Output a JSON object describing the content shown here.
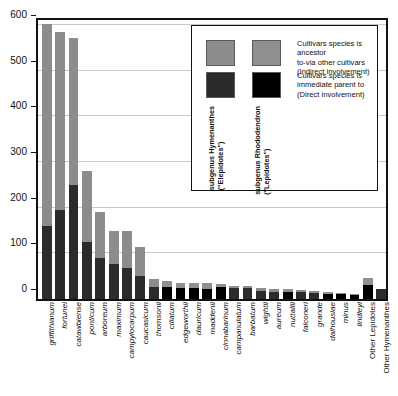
{
  "chart_data": {
    "type": "bar",
    "subtype": "stacked",
    "title": "",
    "xlabel": "",
    "ylabel": "",
    "ylim": [
      0,
      620
    ],
    "yticks": [
      0,
      100,
      200,
      300,
      400,
      500,
      600
    ],
    "grid": true,
    "legend_position": "top-right-inside",
    "categories": [
      "griffithianum",
      "fortunei",
      "catawbiense",
      "ponticum",
      "arboreum",
      "maximum",
      "campylocarpum",
      "caucasicum",
      "thomsonii",
      "ciliatum",
      "edgeworthii",
      "dauricum",
      "maddenii",
      "cinnabarinum",
      "campanulatum",
      "barbatum",
      "wightii",
      "aureum",
      "nuttallii",
      "falconeri",
      "grande",
      "dalhousiae",
      "minus",
      "lindleyi",
      "Other Lepidotes",
      "Other Hymenanthes"
    ],
    "category_styles": [
      "italic",
      "italic",
      "italic",
      "italic",
      "italic",
      "italic",
      "italic",
      "italic",
      "italic",
      "italic",
      "italic",
      "italic",
      "italic",
      "italic",
      "italic",
      "italic",
      "italic",
      "italic",
      "italic",
      "italic",
      "italic",
      "italic",
      "italic",
      "italic",
      "plain",
      "plain"
    ],
    "category_subgenus": [
      "Hymenanthes",
      "Hymenanthes",
      "Hymenanthes",
      "Hymenanthes",
      "Hymenanthes",
      "Hymenanthes",
      "Hymenanthes",
      "Hymenanthes",
      "Hymenanthes",
      "Rhododendron",
      "Rhododendron",
      "Rhododendron",
      "Rhododendron",
      "Rhododendron",
      "Hymenanthes",
      "Hymenanthes",
      "Hymenanthes",
      "Hymenanthes",
      "Rhododendron",
      "Hymenanthes",
      "Hymenanthes",
      "Rhododendron",
      "Rhododendron",
      "Rhododendron",
      "Rhododendron",
      "Hymenanthes"
    ],
    "series": [
      {
        "name": "Cultivars species is immediate parent to (Direct involvement)",
        "key": "direct",
        "values": [
          160,
          196,
          250,
          125,
          89,
          77,
          68,
          51,
          27,
          27,
          25,
          25,
          23,
          26,
          24,
          24,
          18,
          16,
          16,
          15,
          13,
          12,
          10,
          9,
          31,
          22
        ]
      },
      {
        "name": "Cultivars species is ancestor to-via other cultivars (Indirect involvement)",
        "key": "indirect",
        "values": [
          443,
          389,
          321,
          156,
          102,
          72,
          81,
          62,
          16,
          12,
          11,
          9,
          11,
          7,
          4,
          4,
          6,
          6,
          5,
          4,
          4,
          3,
          3,
          3,
          14,
          0
        ]
      }
    ],
    "totals": [
      603,
      585,
      571,
      281,
      191,
      149,
      149,
      113,
      43,
      39,
      36,
      34,
      34,
      33,
      28,
      28,
      24,
      22,
      21,
      19,
      17,
      15,
      13,
      12,
      45,
      22
    ]
  },
  "legend": {
    "entries": [
      {
        "swatch_color_hymenanthes": "#8c8c8c",
        "swatch_color_rhododendron": "#8f8f8f",
        "text": "Cultivars species is ancestor\n to-via other cultivars\n(Indirect involvement)"
      },
      {
        "swatch_color_hymenanthes": "#2b2b2b",
        "swatch_color_rhododendron": "#000000",
        "text": "Cultivars species is\nimmediate parent to\n(Direct involvement)"
      }
    ],
    "column_labels": [
      "subgenus Hymenanthes\n(\"Elepidotes\")",
      "subgenus Rhododendron\n(\"Lepidotes\")"
    ]
  },
  "colors": {
    "indirect_hymenanthes": "#8c8c8c",
    "indirect_rhododendron": "#8f8f8f",
    "direct_hymenanthes": "#2b2b2b",
    "direct_rhododendron": "#000000",
    "axis": "#111111",
    "grid": "#c9c9c9",
    "background": "#ffffff"
  }
}
